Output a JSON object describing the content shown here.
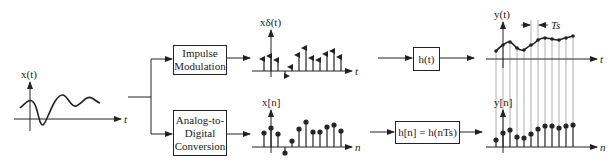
{
  "diagram": {
    "input_signal": {
      "y_label": "x(t)",
      "x_label": "t"
    },
    "top_branch": {
      "block1": "Impulse Modulation",
      "block1_lines": [
        "Impulse",
        "Modulation"
      ],
      "signal_label": "xδ(t)",
      "signal_axis": "t",
      "block2": "h(t)",
      "output_label": "y(t)",
      "output_axis": "t",
      "period_label": "Ts"
    },
    "bottom_branch": {
      "block1": "Analog-to-Digital Conversion",
      "block1_lines": [
        "Analog-to-",
        "Digital",
        "Conversion"
      ],
      "signal_label": "x[n]",
      "signal_axis": "n",
      "block2": "h[n] = h(nTs)",
      "output_label": "y[n]",
      "output_axis": "n"
    },
    "colors": {
      "line": "#222222",
      "guide": "#999999",
      "background": "#ffffff"
    }
  }
}
